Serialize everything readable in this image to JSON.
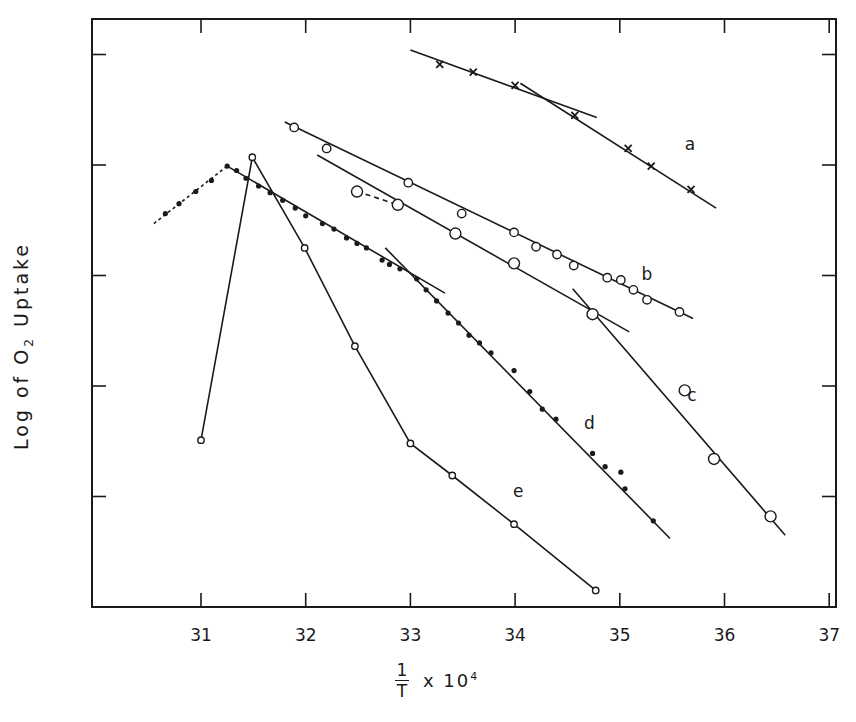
{
  "chart_data": {
    "type": "scatter",
    "title": "",
    "xlabel": "1/T x 10^4",
    "xlabel_parts": {
      "numerator": "1",
      "denominator": "T",
      "suffix": "x 10",
      "exponent": "4"
    },
    "ylabel": "Log of O2 Uptake",
    "ylabel_parts": {
      "prefix": "Log  of  O",
      "subscript": "2",
      "suffix": " Uptake"
    },
    "xlim": [
      30.03,
      37.0
    ],
    "ylim": [
      0,
      5.32
    ],
    "xticks": [
      31,
      32,
      33,
      34,
      35,
      36,
      37
    ],
    "yticks": [
      1,
      2,
      3,
      4,
      5
    ],
    "ytick_labels": [],
    "grid": false,
    "legend": "inline letters a-e",
    "series": [
      {
        "name": "a",
        "marker": "x",
        "label_pos": [
          35.67,
          4.14
        ],
        "points": [
          [
            33.28,
            4.91
          ],
          [
            33.6,
            4.84
          ],
          [
            34.0,
            4.72
          ],
          [
            34.57,
            4.45
          ],
          [
            35.08,
            4.15
          ],
          [
            35.3,
            3.99
          ],
          [
            35.68,
            3.78
          ]
        ],
        "fit_lines": [
          {
            "style": "solid",
            "from": [
              33.0,
              5.04
            ],
            "to": [
              34.78,
              4.43
            ]
          },
          {
            "style": "solid",
            "from": [
              34.05,
              4.74
            ],
            "to": [
              35.92,
              3.61
            ]
          }
        ]
      },
      {
        "name": "b",
        "marker": "open-circle",
        "label_pos": [
          35.26,
          2.96
        ],
        "points": [
          [
            31.89,
            4.34
          ],
          [
            32.2,
            4.15
          ],
          [
            32.98,
            3.84
          ],
          [
            33.49,
            3.56
          ],
          [
            33.99,
            3.39
          ],
          [
            34.2,
            3.26
          ],
          [
            34.4,
            3.19
          ],
          [
            34.56,
            3.09
          ],
          [
            34.88,
            2.98
          ],
          [
            35.01,
            2.96
          ],
          [
            35.13,
            2.87
          ],
          [
            35.26,
            2.78
          ],
          [
            35.57,
            2.67
          ]
        ],
        "fit_lines": [
          {
            "style": "solid",
            "from": [
              31.8,
              4.39
            ],
            "to": [
              35.7,
              2.61
            ]
          }
        ]
      },
      {
        "name": "c",
        "marker": "open-circle-large",
        "label_pos": [
          35.69,
          1.86
        ],
        "points": [
          [
            32.49,
            3.76
          ],
          [
            32.88,
            3.64
          ],
          [
            33.43,
            3.38
          ],
          [
            33.99,
            3.11
          ],
          [
            34.74,
            2.65
          ],
          [
            35.62,
            1.96
          ],
          [
            35.9,
            1.34
          ],
          [
            36.44,
            0.82
          ]
        ],
        "fit_lines": [
          {
            "style": "dashed",
            "from": [
              32.49,
              3.76
            ],
            "to": [
              32.88,
              3.64
            ]
          },
          {
            "style": "solid",
            "from": [
              32.11,
              4.09
            ],
            "to": [
              35.09,
              2.49
            ]
          },
          {
            "style": "solid",
            "from": [
              34.55,
              2.88
            ],
            "to": [
              36.58,
              0.65
            ]
          }
        ]
      },
      {
        "name": "d",
        "marker": "filled-dot",
        "label_pos": [
          34.71,
          1.61
        ],
        "points": [
          [
            30.66,
            3.56
          ],
          [
            30.79,
            3.65
          ],
          [
            30.95,
            3.76
          ],
          [
            31.1,
            3.86
          ],
          [
            31.25,
            3.99
          ],
          [
            31.34,
            3.95
          ],
          [
            31.43,
            3.88
          ],
          [
            31.55,
            3.81
          ],
          [
            31.66,
            3.75
          ],
          [
            31.78,
            3.68
          ],
          [
            31.9,
            3.61
          ],
          [
            32.0,
            3.54
          ],
          [
            32.16,
            3.47
          ],
          [
            32.27,
            3.42
          ],
          [
            32.39,
            3.34
          ],
          [
            32.49,
            3.29
          ],
          [
            32.58,
            3.25
          ],
          [
            32.73,
            3.14
          ],
          [
            32.8,
            3.1
          ],
          [
            32.9,
            3.06
          ],
          [
            33.06,
            2.97
          ],
          [
            33.15,
            2.87
          ],
          [
            33.25,
            2.77
          ],
          [
            33.36,
            2.66
          ],
          [
            33.46,
            2.57
          ],
          [
            33.56,
            2.46
          ],
          [
            33.66,
            2.39
          ],
          [
            33.77,
            2.3
          ],
          [
            33.99,
            2.14
          ],
          [
            34.14,
            1.95
          ],
          [
            34.26,
            1.79
          ],
          [
            34.39,
            1.7
          ],
          [
            34.74,
            1.39
          ],
          [
            34.86,
            1.27
          ],
          [
            35.01,
            1.22
          ],
          [
            35.05,
            1.07
          ],
          [
            35.32,
            0.78
          ]
        ],
        "fit_lines": [
          {
            "style": "dotted",
            "from": [
              30.55,
              3.47
            ],
            "to": [
              31.25,
              3.99
            ]
          },
          {
            "style": "solid",
            "from": [
              31.25,
              3.99
            ],
            "to": [
              33.33,
              2.84
            ]
          },
          {
            "style": "solid",
            "from": [
              32.76,
              3.25
            ],
            "to": [
              35.48,
              0.62
            ]
          }
        ]
      },
      {
        "name": "e",
        "marker": "open-circle-small",
        "label_pos": [
          34.03,
          1.0
        ],
        "points": [
          [
            31.0,
            1.51
          ],
          [
            31.49,
            4.07
          ],
          [
            31.99,
            3.25
          ],
          [
            32.47,
            2.36
          ],
          [
            33.0,
            1.48
          ],
          [
            33.4,
            1.19
          ],
          [
            33.99,
            0.75
          ],
          [
            34.77,
            0.15
          ]
        ],
        "fit_lines": [
          {
            "style": "polyline"
          }
        ]
      }
    ]
  },
  "layout_px": {
    "frame": {
      "left": 92,
      "right": 836,
      "top": 19,
      "bottom": 607
    },
    "x_origin_value": 31,
    "x_origin_px": 201,
    "x_px_per_unit": 104.7,
    "y_zero_px": 607,
    "y_px_per_unit": 110.5
  }
}
